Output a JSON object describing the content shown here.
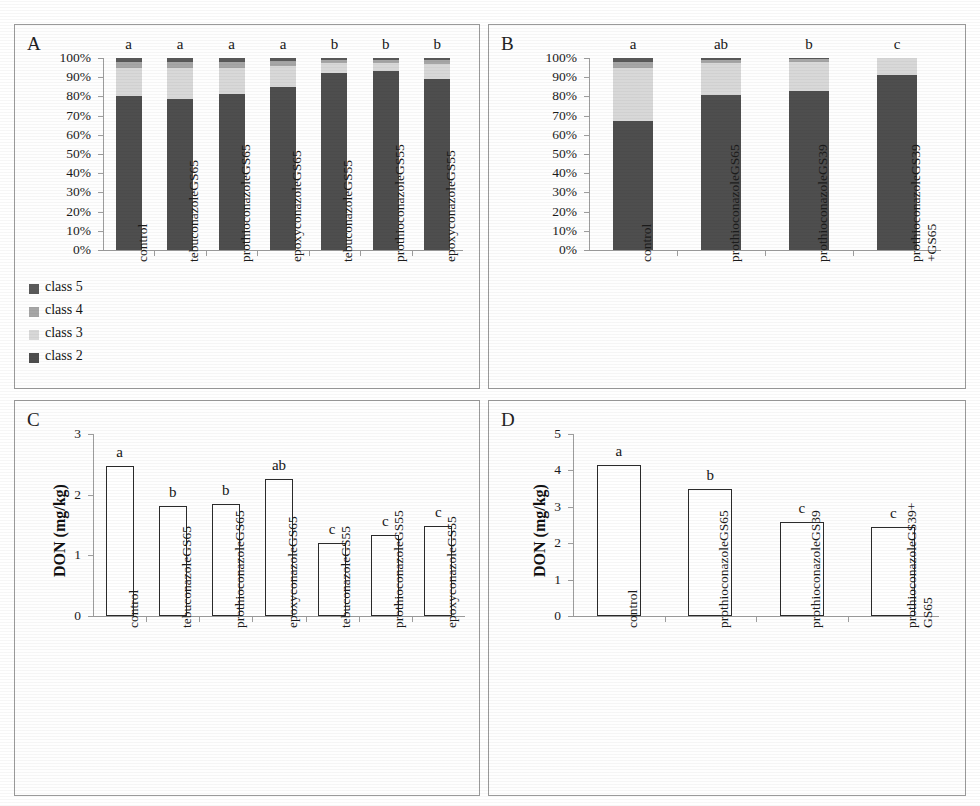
{
  "figure": {
    "panels": [
      "A",
      "B",
      "C",
      "D"
    ]
  },
  "panel_a": {
    "letter": "A",
    "legend": [
      {
        "label": "class 5",
        "color": "#595959"
      },
      {
        "label": "class 4",
        "color": "#a6a6a6"
      },
      {
        "label": "class 3",
        "color": "#d8d8d8"
      },
      {
        "label": "class 2",
        "color": "#4e4e4e"
      }
    ]
  },
  "panel_b": {
    "letter": "B"
  },
  "panel_c": {
    "letter": "C"
  },
  "panel_d": {
    "letter": "D"
  },
  "chart_data": [
    {
      "panel": "A",
      "type": "bar",
      "stacked": true,
      "title": "",
      "xlabel": "",
      "ylabel": "",
      "ylim": [
        0,
        100
      ],
      "ytick_labels": [
        "100%",
        "90%",
        "80%",
        "70%",
        "60%",
        "50%",
        "40%",
        "30%",
        "20%",
        "10%",
        "0%"
      ],
      "ytick_values": [
        100,
        90,
        80,
        70,
        60,
        50,
        40,
        30,
        20,
        10,
        0
      ],
      "grid": false,
      "legend": [
        "class 5",
        "class 4",
        "class 3",
        "class 2"
      ],
      "legend_position": "below-left",
      "categories": [
        "control",
        "tebuconazoleGS65",
        "prothioconazoleGS65",
        "epoxyconazoleGS65",
        "tebuconazoleGS55",
        "prothioconazoleGS55",
        "epoxyconazoleGS55"
      ],
      "series": [
        {
          "name": "class 2",
          "color": "#4e4e4e",
          "values": [
            80,
            78.5,
            81.5,
            85,
            92,
            93,
            89
          ]
        },
        {
          "name": "class 3",
          "color": "#d8d8d8",
          "values": [
            15,
            16.5,
            13.5,
            11,
            5.5,
            4.5,
            8
          ]
        },
        {
          "name": "class 4",
          "color": "#a6a6a6",
          "values": [
            3,
            3,
            3,
            2.5,
            1.5,
            1.5,
            2
          ]
        },
        {
          "name": "class 5",
          "color": "#595959",
          "values": [
            2,
            2,
            2,
            1.5,
            1,
            1,
            1
          ]
        }
      ],
      "annotations": [
        "a",
        "a",
        "a",
        "a",
        "b",
        "b",
        "b"
      ]
    },
    {
      "panel": "B",
      "type": "bar",
      "stacked": true,
      "title": "",
      "xlabel": "",
      "ylabel": "",
      "ylim": [
        0,
        100
      ],
      "ytick_labels": [
        "100%",
        "90%",
        "80%",
        "70%",
        "60%",
        "50%",
        "40%",
        "30%",
        "20%",
        "10%",
        "0%"
      ],
      "ytick_values": [
        100,
        90,
        80,
        70,
        60,
        50,
        40,
        30,
        20,
        10,
        0
      ],
      "grid": false,
      "legend": [
        "class 5",
        "class 4",
        "class 3",
        "class 2"
      ],
      "legend_position": "none",
      "categories": [
        "control",
        "prothioconazoleGS65",
        "prothioconazoleGS39",
        "prothioconazoleGS39\n+GS65"
      ],
      "series": [
        {
          "name": "class 2",
          "color": "#4e4e4e",
          "values": [
            67,
            80.5,
            83,
            91
          ]
        },
        {
          "name": "class 3",
          "color": "#d8d8d8",
          "values": [
            28,
            17,
            15,
            9
          ]
        },
        {
          "name": "class 4",
          "color": "#a6a6a6",
          "values": [
            3,
            1.5,
            1.5,
            0
          ]
        },
        {
          "name": "class 5",
          "color": "#595959",
          "values": [
            2,
            1,
            0.5,
            0
          ]
        }
      ],
      "annotations": [
        "a",
        "ab",
        "b",
        "c"
      ]
    },
    {
      "panel": "C",
      "type": "bar",
      "stacked": false,
      "title": "",
      "xlabel": "",
      "ylabel": "DON (mg/kg)",
      "ylim": [
        0,
        3
      ],
      "ytick_labels": [
        "3",
        "2",
        "1",
        "0"
      ],
      "ytick_values": [
        3,
        2,
        1,
        0
      ],
      "grid": false,
      "categories": [
        "control",
        "tebuconazoleGS65",
        "prothioconazoleGS65",
        "epoxyconazoleGS65",
        "tebuconazoleGS55",
        "prothioconazoleGS55",
        "epoxyconazoleGS55"
      ],
      "values": [
        2.47,
        1.82,
        1.84,
        2.26,
        1.2,
        1.33,
        1.49
      ],
      "annotations": [
        "a",
        "b",
        "b",
        "ab",
        "c",
        "c",
        "c"
      ]
    },
    {
      "panel": "D",
      "type": "bar",
      "stacked": false,
      "title": "",
      "xlabel": "",
      "ylabel": "DON (mg/kg)",
      "ylim": [
        0,
        5
      ],
      "ytick_labels": [
        "5",
        "4",
        "3",
        "2",
        "1",
        "0"
      ],
      "ytick_values": [
        5,
        4,
        3,
        2,
        1,
        0
      ],
      "grid": false,
      "categories": [
        "control",
        "prothioconazoleGS65",
        "prothioconazoleGS39",
        "prothioconazoleGS39+\nGS65"
      ],
      "values": [
        4.15,
        3.48,
        2.57,
        2.45
      ],
      "annotations": [
        "a",
        "b",
        "c",
        "c"
      ]
    }
  ]
}
